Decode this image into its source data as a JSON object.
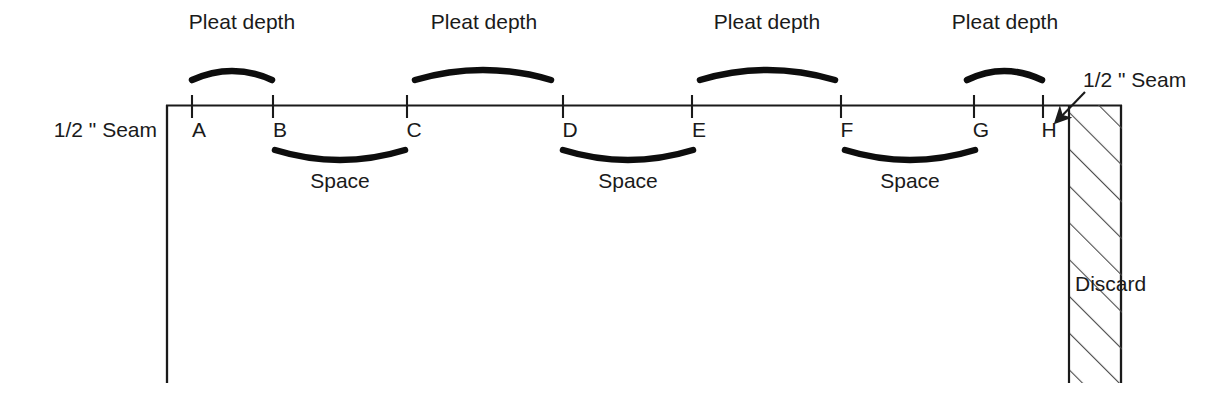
{
  "diagram": {
    "colors": {
      "line": "#1a1a1a",
      "text": "#1a1a1a",
      "hatch": "#4a4a4a",
      "background": "#ffffff"
    },
    "fabric_edge": {
      "top_line_y": 105,
      "left_x": 166,
      "right_x": 1122,
      "bottom_y": 383
    },
    "labels": {
      "seam_left": "1/2 \" Seam",
      "seam_right": "1/2 \" Seam",
      "discard": "Discard",
      "pleat_depth": "Pleat depth",
      "space": "Space"
    },
    "points": [
      {
        "id": "A",
        "label": "A",
        "x": 192
      },
      {
        "id": "B",
        "label": "B",
        "x": 273
      },
      {
        "id": "C",
        "label": "C",
        "x": 407
      },
      {
        "id": "D",
        "label": "D",
        "x": 563
      },
      {
        "id": "E",
        "label": "E",
        "x": 692
      },
      {
        "id": "F",
        "label": "F",
        "x": 841
      },
      {
        "id": "G",
        "label": "G",
        "x": 974
      },
      {
        "id": "H",
        "label": "H",
        "x": 1043
      }
    ],
    "pleat_brackets": [
      {
        "label": "Pleat depth",
        "from": "A",
        "to": "B",
        "x1": 192,
        "x2": 272,
        "label_x": 242,
        "label_y": 29
      },
      {
        "label": "Pleat depth",
        "from": "C",
        "to": "D",
        "x1": 415,
        "x2": 551,
        "label_x": 484,
        "label_y": 29
      },
      {
        "label": "Pleat depth",
        "from": "E",
        "to": "F",
        "x1": 700,
        "x2": 835,
        "label_x": 767,
        "label_y": 29
      },
      {
        "label": "Pleat depth",
        "from": "G",
        "to": "H",
        "x1": 967,
        "x2": 1042,
        "label_x": 1005,
        "label_y": 29
      }
    ],
    "space_brackets": [
      {
        "label": "Space",
        "from": "B",
        "to": "C",
        "x1": 275,
        "x2": 405,
        "label_x": 340,
        "label_y": 188
      },
      {
        "label": "Space",
        "from": "D",
        "to": "E",
        "x1": 563,
        "x2": 693,
        "label_x": 628,
        "label_y": 188
      },
      {
        "label": "Space",
        "from": "F",
        "to": "G",
        "x1": 845,
        "x2": 975,
        "label_x": 910,
        "label_y": 188
      }
    ],
    "seam_left_label": {
      "text": "1/2 \" Seam",
      "x": 155,
      "y": 137
    },
    "seam_right_label": {
      "text": "1/2 \" Seam",
      "x": 1082,
      "y": 87
    },
    "discard_label": {
      "text": "Discard",
      "x": 1075,
      "y": 290
    },
    "hatch_region": {
      "x1": 1068,
      "x2": 1122,
      "y1": 105,
      "y2": 383
    },
    "arrow": {
      "from_x": 1083,
      "from_y": 93,
      "to_x": 1058,
      "to_y": 119
    }
  }
}
